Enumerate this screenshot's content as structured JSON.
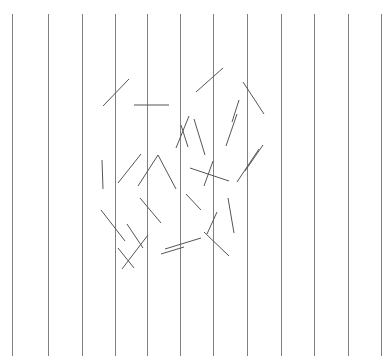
{
  "canvas": {
    "width": 392,
    "height": 364,
    "background_color": "#ffffff",
    "title": "vertical-grid-with-scattered-segments"
  },
  "grid": {
    "name": "vertical-reference-lines",
    "count": 12,
    "color": "#808080",
    "stroke_width": 1,
    "y_top": 14,
    "y_bottom": 356,
    "spacing": 33.5,
    "x_positions": [
      12,
      48,
      82,
      115,
      147,
      180,
      213,
      247,
      281,
      314,
      348,
      381
    ]
  },
  "segments": {
    "name": "scattered-line-segments",
    "count": 28,
    "color": "#555555",
    "stroke_width": 1,
    "cluster_region": {
      "x_min": 98,
      "x_max": 268,
      "y_min": 66,
      "y_max": 272
    },
    "lines": [
      {
        "id": "seg-01",
        "x1": 103,
        "y1": 106,
        "x2": 129,
        "y2": 79
      },
      {
        "id": "seg-02",
        "x1": 134,
        "y1": 105,
        "x2": 169,
        "y2": 105
      },
      {
        "id": "seg-03",
        "x1": 196,
        "y1": 92,
        "x2": 223,
        "y2": 68
      },
      {
        "id": "seg-04",
        "x1": 243,
        "y1": 82,
        "x2": 264,
        "y2": 114
      },
      {
        "id": "seg-05",
        "x1": 176,
        "y1": 148,
        "x2": 189,
        "y2": 116
      },
      {
        "id": "seg-06",
        "x1": 194,
        "y1": 119,
        "x2": 205,
        "y2": 155
      },
      {
        "id": "seg-07",
        "x1": 226,
        "y1": 146,
        "x2": 237,
        "y2": 114
      },
      {
        "id": "seg-08",
        "x1": 102,
        "y1": 160,
        "x2": 103,
        "y2": 189
      },
      {
        "id": "seg-09",
        "x1": 118,
        "y1": 183,
        "x2": 141,
        "y2": 154
      },
      {
        "id": "seg-10",
        "x1": 138,
        "y1": 186,
        "x2": 158,
        "y2": 155
      },
      {
        "id": "seg-11",
        "x1": 158,
        "y1": 155,
        "x2": 176,
        "y2": 189
      },
      {
        "id": "seg-12",
        "x1": 190,
        "y1": 168,
        "x2": 229,
        "y2": 181
      },
      {
        "id": "seg-13",
        "x1": 237,
        "y1": 182,
        "x2": 259,
        "y2": 149
      },
      {
        "id": "seg-14",
        "x1": 245,
        "y1": 171,
        "x2": 263,
        "y2": 145
      },
      {
        "id": "seg-15",
        "x1": 101,
        "y1": 210,
        "x2": 125,
        "y2": 241
      },
      {
        "id": "seg-16",
        "x1": 122,
        "y1": 269,
        "x2": 148,
        "y2": 235
      },
      {
        "id": "seg-17",
        "x1": 140,
        "y1": 198,
        "x2": 161,
        "y2": 223
      },
      {
        "id": "seg-18",
        "x1": 186,
        "y1": 194,
        "x2": 201,
        "y2": 210
      },
      {
        "id": "seg-19",
        "x1": 165,
        "y1": 249,
        "x2": 201,
        "y2": 238
      },
      {
        "id": "seg-20",
        "x1": 204,
        "y1": 232,
        "x2": 229,
        "y2": 256
      },
      {
        "id": "seg-21",
        "x1": 228,
        "y1": 198,
        "x2": 234,
        "y2": 233
      },
      {
        "id": "seg-22",
        "x1": 207,
        "y1": 234,
        "x2": 217,
        "y2": 212
      },
      {
        "id": "seg-23",
        "x1": 127,
        "y1": 224,
        "x2": 143,
        "y2": 248
      },
      {
        "id": "seg-24",
        "x1": 204,
        "y1": 186,
        "x2": 213,
        "y2": 161
      },
      {
        "id": "seg-25",
        "x1": 118,
        "y1": 248,
        "x2": 134,
        "y2": 268
      },
      {
        "id": "seg-26",
        "x1": 161,
        "y1": 254,
        "x2": 184,
        "y2": 247
      },
      {
        "id": "seg-27",
        "x1": 232,
        "y1": 122,
        "x2": 239,
        "y2": 100
      },
      {
        "id": "seg-28",
        "x1": 181,
        "y1": 125,
        "x2": 188,
        "y2": 147
      }
    ]
  }
}
